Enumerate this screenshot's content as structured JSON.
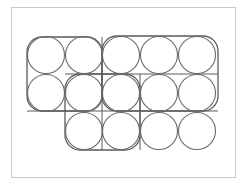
{
  "diagram": {
    "stroke_color": "#5a5a5a",
    "circle_stroke_color": "#6a6a6a",
    "frame_color": "#c8c8c8",
    "circle_radius": 18.5,
    "columns_x": [
      46,
      84,
      121,
      159,
      197
    ],
    "rows_y": [
      55,
      93,
      131
    ],
    "circles": [
      {
        "row": 0,
        "col": 0
      },
      {
        "row": 0,
        "col": 1
      },
      {
        "row": 0,
        "col": 2
      },
      {
        "row": 0,
        "col": 3
      },
      {
        "row": 0,
        "col": 4
      },
      {
        "row": 1,
        "col": 0
      },
      {
        "row": 1,
        "col": 1
      },
      {
        "row": 1,
        "col": 2
      },
      {
        "row": 1,
        "col": 3
      },
      {
        "row": 1,
        "col": 4
      },
      {
        "row": 2,
        "col": 1
      },
      {
        "row": 2,
        "col": 2
      },
      {
        "row": 2,
        "col": 3
      },
      {
        "row": 2,
        "col": 4
      }
    ],
    "groups": [
      {
        "name": "left-2x2-group",
        "x": 27,
        "y": 37,
        "w": 75,
        "h": 74,
        "r": 15
      },
      {
        "name": "right-3x2-group",
        "x": 102,
        "y": 36,
        "w": 116,
        "h": 75,
        "r": 15
      },
      {
        "name": "middle-2x2-group",
        "x": 65,
        "y": 74,
        "w": 75,
        "h": 76,
        "r": 15
      }
    ],
    "lines": [
      {
        "name": "horizontal-line-row1-row2",
        "x1": 65,
        "y1": 74,
        "x2": 218,
        "y2": 74
      },
      {
        "name": "horizontal-line-row2-row3",
        "x1": 27,
        "y1": 111,
        "x2": 218,
        "y2": 111
      },
      {
        "name": "vertical-line-col2-col3",
        "x1": 102,
        "y1": 37,
        "x2": 102,
        "y2": 150
      },
      {
        "name": "vertical-line-col3-col4",
        "x1": 140,
        "y1": 74,
        "x2": 140,
        "y2": 150
      }
    ]
  }
}
